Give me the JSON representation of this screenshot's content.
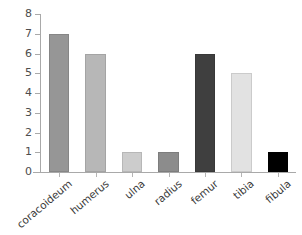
{
  "chart_data": {
    "type": "bar",
    "title": "",
    "subtitle": "",
    "xlabel": "",
    "ylabel": "",
    "categories": [
      "coracoideum",
      "humerus",
      "ulna",
      "radius",
      "femur",
      "tibia",
      "fibula"
    ],
    "values": [
      7,
      6,
      1,
      1,
      6,
      5,
      1
    ],
    "ylim": [
      0,
      8
    ],
    "ytick_labels": [
      "0",
      "1",
      "2",
      "3",
      "4",
      "5",
      "6",
      "7",
      "8"
    ],
    "ytick_values": [
      0,
      1,
      2,
      3,
      4,
      5,
      6,
      7,
      8
    ],
    "grid": false,
    "legend": false,
    "legend_position": "none",
    "bar_colors": [
      "#969696",
      "#b7b7b7",
      "#cccccc",
      "#8c8c8c",
      "#3f3f3f",
      "#e2e2e2",
      "#000000"
    ],
    "axis_color": "#a9a9a9",
    "label_rotation": -40,
    "background": "#ffffff",
    "annotations": []
  }
}
